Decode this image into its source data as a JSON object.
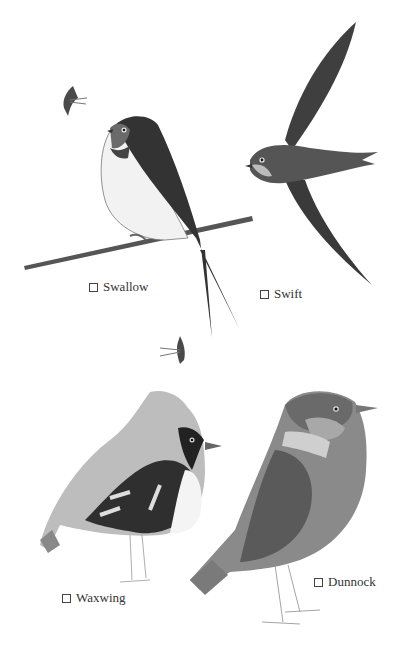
{
  "page": {
    "type": "bird-spotting-checklist",
    "palette": "grayscale watercolor"
  },
  "birds": [
    {
      "name": "Swallow",
      "checked": false
    },
    {
      "name": "Swift",
      "checked": false
    },
    {
      "name": "Waxwing",
      "checked": false
    },
    {
      "name": "Dunnock",
      "checked": false
    }
  ],
  "decorations": [
    {
      "name": "small-swallow-silhouette-top-left"
    },
    {
      "name": "small-swallow-silhouette-middle"
    }
  ],
  "colors": {
    "background": "#ffffff",
    "ink": "#333333",
    "dark_plumage": "#3a3a3a",
    "mid_plumage": "#7a7a7a",
    "light_plumage": "#c8c8c8"
  }
}
